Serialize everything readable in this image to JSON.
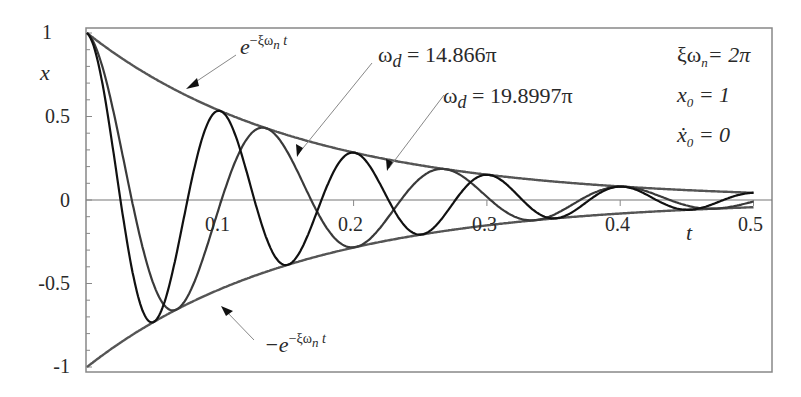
{
  "chart_data": {
    "type": "line",
    "title": "",
    "xlabel": "t",
    "ylabel": "x",
    "xlim": [
      0,
      0.5
    ],
    "ylim": [
      -1,
      1
    ],
    "xticks": [
      0.1,
      0.2,
      0.3,
      0.4,
      0.5
    ],
    "xtick_labels": [
      "0.1",
      "0.2",
      "0.3",
      "0.4",
      "0.5"
    ],
    "yticks": [
      1,
      0.5,
      0,
      -0.5,
      -1
    ],
    "ytick_labels": [
      "1",
      "0.5",
      "0",
      "-0.5",
      "-1"
    ],
    "grid": false,
    "legend": "none (inline annotations)",
    "parameters": {
      "xi_omega_n": "2π",
      "x0": "1",
      "x0_dot": "0"
    },
    "series": [
      {
        "name": "e^{-ξωn t}",
        "kind": "envelope",
        "sign": 1,
        "decay": 6.2832
      },
      {
        "name": "-e^{-ξωn t}",
        "kind": "envelope",
        "sign": -1,
        "decay": 6.2832
      },
      {
        "name": "ωd = 14.866π",
        "kind": "damped",
        "omega_pi": 14.866,
        "decay": 6.2832
      },
      {
        "name": "ωd = 19.8997π",
        "kind": "damped",
        "omega_pi": 19.8997,
        "decay": 6.2832
      }
    ],
    "sample_points": {
      "t": [
        0,
        0.05,
        0.1,
        0.15,
        0.2,
        0.25,
        0.3,
        0.35,
        0.4,
        0.45,
        0.5
      ],
      "envelope": [
        1,
        0.73,
        0.533,
        0.39,
        0.285,
        0.208,
        0.152,
        0.111,
        0.081,
        0.059,
        0.043
      ]
    }
  },
  "labels": {
    "y_axis": "x",
    "x_axis": "t",
    "envelope_upper": {
      "base": "e",
      "exp": "−ξω",
      "exp_sub": "n",
      "exp_tail": " t"
    },
    "envelope_lower": {
      "base": "−e",
      "exp": "−ξω",
      "exp_sub": "n",
      "exp_tail": " t"
    },
    "omega1": {
      "sym": "ω",
      "sub": "d",
      "val": " = 14.866π"
    },
    "omega2": {
      "sym": "ω",
      "sub": "d",
      "val": " = 19.8997π"
    },
    "param1": {
      "sym": "ξω",
      "sub": "n",
      "val": "= 2π"
    },
    "param2": {
      "sym": "x",
      "sub": "0",
      "val": " = 1"
    },
    "param3": {
      "sym": "ẋ",
      "sub": "0",
      "val": " = 0"
    }
  },
  "colors": {
    "curve": "#1a1a1a",
    "envelope": "#555555",
    "axis": "#777777",
    "leader": "#888888"
  }
}
